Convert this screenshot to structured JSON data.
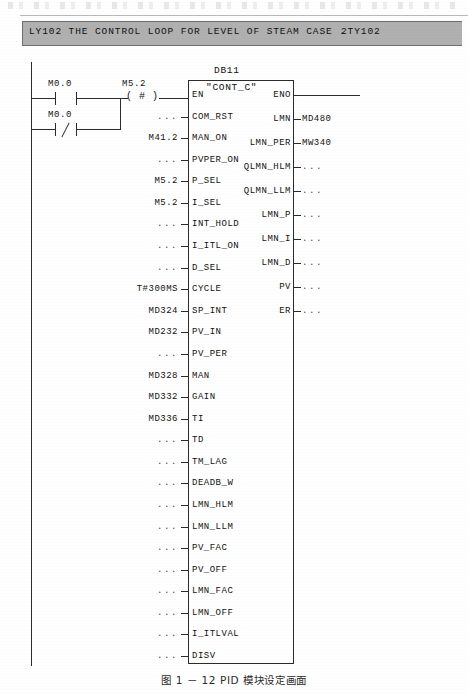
{
  "window": {
    "title_text": "LY102 THE CONTROL LOOP FOR LEVEL OF STEAM CASE .",
    "title_tag": "2TY102"
  },
  "ladder": {
    "contact1_label": "M0.0",
    "contact1_type": "normally-open",
    "contact2_label": "M0.0",
    "contact2_type": "normally-closed",
    "coil_label": "M5.2",
    "coil_symbol": "( # )"
  },
  "block": {
    "db_name": "DB11",
    "type_name": "\"CONT_C\"",
    "inputs": [
      {
        "pin": "EN",
        "value": ""
      },
      {
        "pin": "COM_RST",
        "value": "..."
      },
      {
        "pin": "MAN_ON",
        "value": "M41.2"
      },
      {
        "pin": "PVPER_ON",
        "value": "..."
      },
      {
        "pin": "P_SEL",
        "value": "M5.2"
      },
      {
        "pin": "I_SEL",
        "value": "M5.2"
      },
      {
        "pin": "INT_HOLD",
        "value": "..."
      },
      {
        "pin": "I_ITL_ON",
        "value": "..."
      },
      {
        "pin": "D_SEL",
        "value": "..."
      },
      {
        "pin": "CYCLE",
        "value": "T#300MS"
      },
      {
        "pin": "SP_INT",
        "value": "MD324"
      },
      {
        "pin": "PV_IN",
        "value": "MD232"
      },
      {
        "pin": "PV_PER",
        "value": "..."
      },
      {
        "pin": "MAN",
        "value": "MD328"
      },
      {
        "pin": "GAIN",
        "value": "MD332"
      },
      {
        "pin": "TI",
        "value": "MD336"
      },
      {
        "pin": "TD",
        "value": "..."
      },
      {
        "pin": "TM_LAG",
        "value": "..."
      },
      {
        "pin": "DEADB_W",
        "value": "..."
      },
      {
        "pin": "LMN_HLM",
        "value": "..."
      },
      {
        "pin": "LMN_LLM",
        "value": "..."
      },
      {
        "pin": "PV_FAC",
        "value": "..."
      },
      {
        "pin": "PV_OFF",
        "value": "..."
      },
      {
        "pin": "LMN_FAC",
        "value": "..."
      },
      {
        "pin": "LMN_OFF",
        "value": "..."
      },
      {
        "pin": "I_ITLVAL",
        "value": "..."
      },
      {
        "pin": "DISV",
        "value": "..."
      }
    ],
    "outputs": [
      {
        "pin": "ENO",
        "value": ""
      },
      {
        "pin": "LMN",
        "value": "MD480"
      },
      {
        "pin": "LMN_PER",
        "value": "MW340"
      },
      {
        "pin": "QLMN_HLM",
        "value": "..."
      },
      {
        "pin": "QLMN_LLM",
        "value": "..."
      },
      {
        "pin": "LMN_P",
        "value": "..."
      },
      {
        "pin": "LMN_I",
        "value": "..."
      },
      {
        "pin": "LMN_D",
        "value": "..."
      },
      {
        "pin": "PV",
        "value": "..."
      },
      {
        "pin": "ER",
        "value": "..."
      }
    ]
  },
  "caption": {
    "text": "图 1 － 12   PID 模块设定画面"
  },
  "colors": {
    "titlebar_fill": "#b0b0b0",
    "titlebar_border": "#6d6d6d",
    "line": "#2b2b2b",
    "page": "#ffffff"
  }
}
